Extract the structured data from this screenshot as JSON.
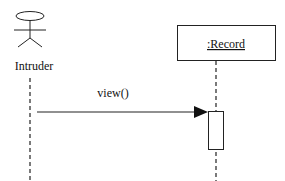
{
  "diagram_type": "UML sequence diagram",
  "actor": {
    "name": "Intruder",
    "icon": "stick-figure-actor-icon"
  },
  "object": {
    "name": ":Record",
    "underlined": true
  },
  "messages": [
    {
      "label": "view()",
      "from": "Intruder",
      "to": ":Record",
      "arrow": "filled-synchronous"
    }
  ],
  "colors": {
    "line": "#111111",
    "background": "#ffffff"
  }
}
